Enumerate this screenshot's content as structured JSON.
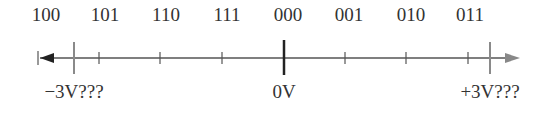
{
  "codes": [
    {
      "label": "100",
      "x": 46
    },
    {
      "label": "101",
      "x": 105
    },
    {
      "label": "110",
      "x": 166
    },
    {
      "label": "111",
      "x": 227
    },
    {
      "label": "000",
      "x": 288
    },
    {
      "label": "001",
      "x": 349
    },
    {
      "label": "010",
      "x": 411
    },
    {
      "label": "011",
      "x": 470
    }
  ],
  "voltages": {
    "neg": {
      "label": "−3V???",
      "x": 74
    },
    "zero": {
      "label": "0V",
      "x": 284
    },
    "pos": {
      "label": "+3V???",
      "x": 490
    }
  },
  "colors": {
    "axis": "#555555",
    "gray_tick": "#8a8a8a",
    "zero_tick": "#222222"
  }
}
